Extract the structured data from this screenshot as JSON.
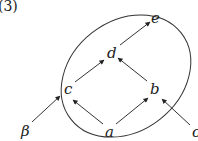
{
  "diagram": {
    "label": "(3)",
    "nodes": [
      {
        "id": "e",
        "label": "e",
        "x": 155,
        "y": 19
      },
      {
        "id": "d",
        "label": "d",
        "x": 112,
        "y": 53
      },
      {
        "id": "c",
        "label": "c",
        "x": 69,
        "y": 89
      },
      {
        "id": "b",
        "label": "b",
        "x": 155,
        "y": 89
      },
      {
        "id": "a",
        "label": "a",
        "x": 110,
        "y": 132
      },
      {
        "id": "beta",
        "label": "β",
        "x": 27,
        "y": 132
      },
      {
        "id": "o",
        "label": "o",
        "x": 194,
        "y": 132
      }
    ],
    "edges": [
      {
        "from": "a",
        "to": "c"
      },
      {
        "from": "a",
        "to": "b"
      },
      {
        "from": "c",
        "to": "d"
      },
      {
        "from": "b",
        "to": "d"
      },
      {
        "from": "d",
        "to": "e"
      },
      {
        "from": "beta",
        "to": "c"
      },
      {
        "from": "o",
        "to": "b"
      }
    ],
    "enclosure": {
      "shape": "ellipse",
      "contains": [
        "a",
        "b",
        "c",
        "d",
        "e"
      ]
    },
    "colors": {
      "stroke": "#333333",
      "background": "#ffffff"
    }
  }
}
